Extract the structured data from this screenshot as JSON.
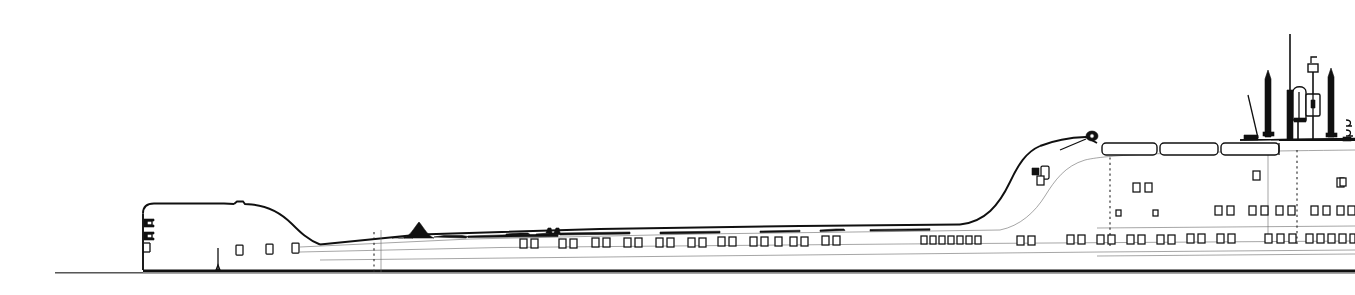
{
  "drawing": {
    "title": "Ship profile outboard line drawing",
    "subject": "Great Lakes bulk freighter — starboard profile",
    "style": "monochrome technical line art",
    "canvas": {
      "width": 1355,
      "height": 295
    },
    "colors": {
      "background": "#ffffff",
      "ink": "#101010",
      "light_ink": "#6a6a6a",
      "mid_ink": "#3a3a3a"
    }
  },
  "geometry": {
    "waterline_y": 272,
    "waterline_x_start": 55,
    "waterline_x_end": 1355,
    "keel_y": 270,
    "bow_stem_x": 143,
    "stern_x": 1355,
    "main_deck_y": 248,
    "forecastle_top_y": 212,
    "forecastle_aft_x": 300,
    "aft_house_start_x": 985,
    "boat_deck_y": 146,
    "bridge_top_y": 139
  },
  "elements": {
    "hull": {
      "name": "hull-profile",
      "description": "long flush-deck hull with raised forecastle forward and deckhouse aft"
    },
    "forecastle": {
      "name": "forecastle-block",
      "hawse_openings": 2,
      "windows": 3
    },
    "waterline": {
      "name": "waterline",
      "label": ""
    },
    "boot_topping": {
      "name": "boot-topping-stripe"
    },
    "deck_fittings": {
      "name": "deck-fittings-row",
      "count": 9
    },
    "cargo_hatches": {
      "name": "cargo-hatch-row",
      "count": 0
    },
    "aft_superstructure": {
      "name": "aft-superstructure",
      "deckhouse_levels": 3,
      "boat_deck_units": 3
    },
    "masts": [
      {
        "name": "signal-mast-forward",
        "x": 1268,
        "top_y": 68
      },
      {
        "name": "main-mast-tall",
        "x": 1292,
        "top_y": 34
      },
      {
        "name": "funnel-uptake",
        "x": 1297,
        "top_y": 84
      },
      {
        "name": "radar-antenna-mast",
        "x": 1312,
        "top_y": 70
      },
      {
        "name": "signal-mast-aft",
        "x": 1332,
        "top_y": 68
      }
    ],
    "station_lines": [
      {
        "name": "station-line-forward",
        "x": 376
      },
      {
        "name": "station-line-midaft",
        "x": 1110
      },
      {
        "name": "station-line-aft",
        "x": 1297
      }
    ]
  },
  "port_rows": {
    "main_row_y": 240,
    "upper_row_y": 212,
    "pairs_midship": [
      520,
      560,
      592,
      624,
      656,
      688,
      718,
      750,
      772,
      794,
      826
    ],
    "aft_cluster": [
      922,
      932,
      942,
      952,
      962,
      972,
      982
    ],
    "aft_pairs": [
      1018,
      1068,
      1098,
      1128,
      1158,
      1188,
      1218,
      1246
    ],
    "stern_cluster_a": [
      1268,
      1280,
      1292
    ],
    "stern_cluster_b": [
      1305,
      1317,
      1329,
      1341
    ],
    "bow_windows": [
      238,
      268,
      294
    ]
  }
}
